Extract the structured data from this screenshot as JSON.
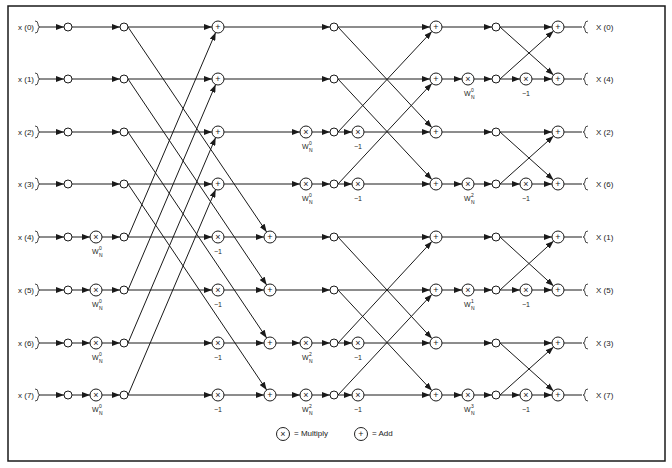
{
  "inputs": [
    "x (0)",
    "x (1)",
    "x (2)",
    "x (3)",
    "x (4)",
    "x (5)",
    "x (6)",
    "x (7)"
  ],
  "outputs": [
    "X (0)",
    "X (4)",
    "X (2)",
    "X (6)",
    "X (1)",
    "X (5)",
    "X (3)",
    "X (7)"
  ],
  "stage1_twiddles": [
    "W",
    "W",
    "W",
    "W"
  ],
  "stage1_twiddle_exp": [
    "0",
    "0",
    "0",
    "0"
  ],
  "stage2_twiddles": [
    {
      "row": 2,
      "exp": "0"
    },
    {
      "row": 3,
      "exp": "0"
    },
    {
      "row": 6,
      "exp": "2"
    },
    {
      "row": 7,
      "exp": "2"
    }
  ],
  "stage3_twiddles": [
    {
      "row": 1,
      "exp": "0"
    },
    {
      "row": 3,
      "exp": "2"
    },
    {
      "row": 5,
      "exp": "1"
    },
    {
      "row": 7,
      "exp": "3"
    }
  ],
  "minus_one": "−1",
  "legend": {
    "multiply_label": "= Multiply",
    "add_label": "= Add"
  },
  "colors": {
    "line": "#1a1a1a",
    "background": "#ffffff"
  }
}
